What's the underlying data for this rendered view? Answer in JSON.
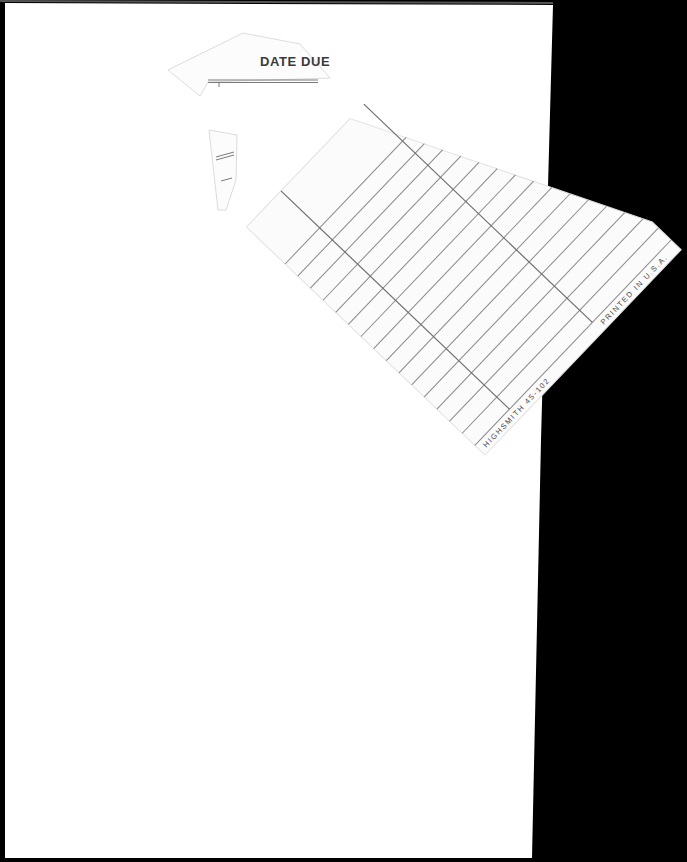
{
  "document": {
    "type": "library date due slip",
    "header": "DATE DUE",
    "imprint_left": "HIGHSMITH 45-102",
    "imprint_right": "PRINTED IN U.S.A.",
    "due_dates": []
  },
  "colors": {
    "background": "#000000",
    "page": "#ffffff",
    "rule_line": "#8a8a8a",
    "text": "#3a3a3a"
  },
  "card_layout": {
    "rotation_deg": -46.3,
    "origin": [
      485,
      455
    ],
    "ruled_rows": 16,
    "row_spacing": 17.5,
    "column_dividers": 2
  }
}
